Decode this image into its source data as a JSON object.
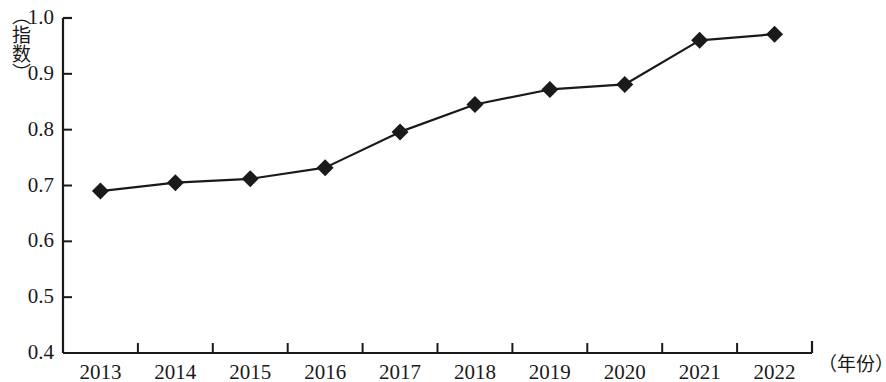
{
  "chart_data": {
    "type": "line",
    "title": "",
    "subtitle": "",
    "xlabel": "（年份）",
    "ylabel": "（指数）",
    "categories": [
      "2013",
      "2014",
      "2015",
      "2016",
      "2017",
      "2018",
      "2019",
      "2020",
      "2021",
      "2022"
    ],
    "values": [
      0.69,
      0.705,
      0.712,
      0.732,
      0.796,
      0.845,
      0.872,
      0.881,
      0.96,
      0.971
    ],
    "series": [
      {
        "name": "指数",
        "values": [
          0.69,
          0.705,
          0.712,
          0.732,
          0.796,
          0.845,
          0.872,
          0.881,
          0.96,
          0.971
        ]
      }
    ],
    "ylim": [
      0.4,
      1.0
    ],
    "ytick_labels": [
      "1.0",
      "0.9",
      "0.8",
      "0.7",
      "0.6",
      "0.5",
      "0.4"
    ],
    "ytick_values": [
      1.0,
      0.9,
      0.8,
      0.7,
      0.6,
      0.5,
      0.4
    ],
    "grid": false,
    "legend": false,
    "legend_position": "none",
    "marker": "diamond",
    "line_color": "#1a1a1a",
    "marker_color": "#1a1a1a",
    "axis_color": "#1a1a1a",
    "background_color": "#ffffff"
  }
}
